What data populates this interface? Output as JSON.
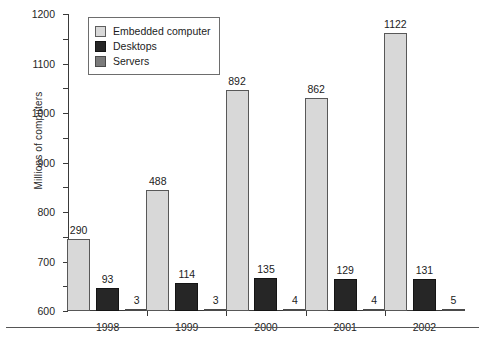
{
  "chart_data": {
    "type": "bar",
    "title": "",
    "xlabel": "",
    "ylabel": "Millions of computers",
    "ylim": [
      0,
      1200
    ],
    "ytick_step": 100,
    "grid": false,
    "legend_position": "top-left",
    "categories": [
      "1998",
      "1999",
      "2000",
      "2001",
      "2002"
    ],
    "yticks": [
      "0",
      "100",
      "200",
      "300",
      "400",
      "500",
      "600",
      "700",
      "800",
      "900",
      "1000",
      "1100",
      "1200"
    ],
    "series": [
      {
        "name": "Embedded computer",
        "color": "#d8d8d8",
        "values": [
          290,
          488,
          892,
          862,
          1122
        ],
        "labels": [
          "290",
          "488",
          "892",
          "862",
          "1122"
        ]
      },
      {
        "name": "Desktops",
        "color": "#262626",
        "values": [
          93,
          114,
          135,
          129,
          131
        ],
        "labels": [
          "93",
          "114",
          "135",
          "129",
          "131"
        ]
      },
      {
        "name": "Servers",
        "color": "#7b7b7b",
        "values": [
          3,
          3,
          4,
          4,
          5
        ],
        "labels": [
          "3",
          "3",
          "4",
          "4",
          "5"
        ]
      }
    ]
  }
}
